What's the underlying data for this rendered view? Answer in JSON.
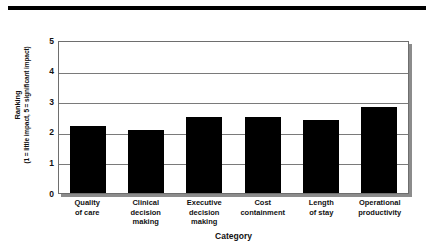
{
  "figure": {
    "top_rule_color": "#000000",
    "bar_color": "#000000",
    "grid_color": "#7a7a7a",
    "plot_border_color": "#6e6e6e",
    "shadow_color": "#8c8c8c",
    "background": "#ffffff"
  },
  "chart_data": {
    "type": "bar",
    "title": "",
    "xlabel": "Category",
    "ylabel": "Ranking",
    "ylabel_sub": "(1 = little impact, 5 = significant impact)",
    "categories": [
      "Quality\nof care",
      "Clinical\ndecision\nmaking",
      "Executive\ndecision\nmaking",
      "Cost\ncontainment",
      "Length\nof stay",
      "Operational\nproductivity"
    ],
    "values": [
      2.2,
      2.05,
      2.5,
      2.5,
      2.4,
      2.8
    ],
    "ylim": [
      0,
      5
    ],
    "yticks": [
      0,
      1,
      2,
      3,
      4,
      5
    ],
    "ytick_labels": [
      "0",
      "1",
      "2",
      "3",
      "4",
      "5"
    ],
    "grid": true,
    "legend": "none",
    "orientation": "vertical"
  }
}
